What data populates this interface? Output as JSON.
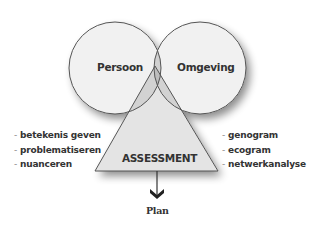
{
  "diagram": {
    "circles": [
      {
        "label": "Persoon"
      },
      {
        "label": "Omgeving"
      }
    ],
    "triangle": {
      "label": "ASSESSMENT"
    },
    "left_list": {
      "dash": "-",
      "items": [
        "betekenis geven",
        "problematiseren",
        "nuanceren"
      ]
    },
    "right_list": {
      "dash": "-",
      "items": [
        "genogram",
        "ecogram",
        "netwerkanalyse"
      ]
    },
    "output": {
      "label": "Plan"
    },
    "colors": {
      "circle_fill": "#f0f0f0",
      "overlap_fill": "#cfcfcf",
      "triangle_fill": "#e2e2e2",
      "stroke": "#555555",
      "text": "#333333"
    }
  }
}
